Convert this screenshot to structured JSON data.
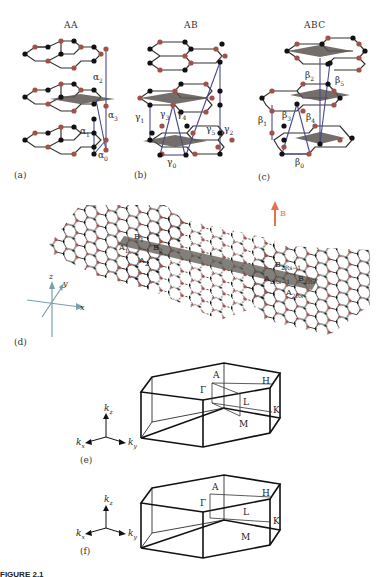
{
  "figure": {
    "panels": {
      "a": {
        "tag": "(a)",
        "title": "AA",
        "labels": [
          "α",
          "α",
          "α",
          "α"
        ],
        "subs": [
          "2",
          "3",
          "1",
          "0"
        ]
      },
      "b": {
        "tag": "(b)",
        "title": "AB",
        "labels": [
          "γ",
          "γ",
          "γ",
          "γ",
          "γ",
          "γ"
        ],
        "subs": [
          "1",
          "3",
          "4",
          "5",
          "2",
          "0"
        ]
      },
      "c": {
        "tag": "(c)",
        "title": "ABC",
        "labels": [
          "β",
          "β",
          "β",
          "β",
          "β",
          "β"
        ],
        "subs": [
          "2",
          "5",
          "1",
          "3",
          "4",
          "0"
        ]
      },
      "d": {
        "tag": "(d)",
        "field_label": "B",
        "axes": {
          "x": "x",
          "y": "y",
          "z": "z"
        },
        "sites": [
          {
            "l": "B",
            "s": "1"
          },
          {
            "l": "A",
            "s": "1"
          },
          {
            "l": "B",
            "s": "2"
          },
          {
            "l": "A",
            "s": "2"
          },
          {
            "l": "B",
            "s": "2Rs−1"
          },
          {
            "l": "A",
            "s": "2Rs−1"
          },
          {
            "l": "B",
            "s": "2Rs"
          },
          {
            "l": "A",
            "s": "2Rs"
          }
        ]
      },
      "e": {
        "tag": "(e)",
        "points": {
          "A": "A",
          "H": "H",
          "Gamma": "Γ",
          "L": "L",
          "K": "K",
          "M": "M"
        },
        "axes": {
          "kz": "k",
          "kx": "k",
          "ky": "k",
          "kz_sub": "z",
          "kx_sub": "x",
          "ky_sub": "y"
        }
      },
      "f": {
        "tag": "(f)",
        "points": {
          "A": "A",
          "H": "H",
          "Gamma": "Γ",
          "L": "L",
          "K": "K",
          "M": "M"
        },
        "axes": {
          "kz": "k",
          "kx": "k",
          "ky": "k",
          "kz_sub": "z",
          "kx_sub": "x",
          "ky_sub": "y"
        }
      }
    },
    "colors": {
      "atom_a": "#111111",
      "atom_b": "#a0524a",
      "bond": "#333333",
      "hopping": "#4a4a8a",
      "shaded": "#5a5550",
      "field_arrow": "#e8704a",
      "axes": "#7aa0a8"
    },
    "caption_fragment": "FIGURE 2.1"
  }
}
